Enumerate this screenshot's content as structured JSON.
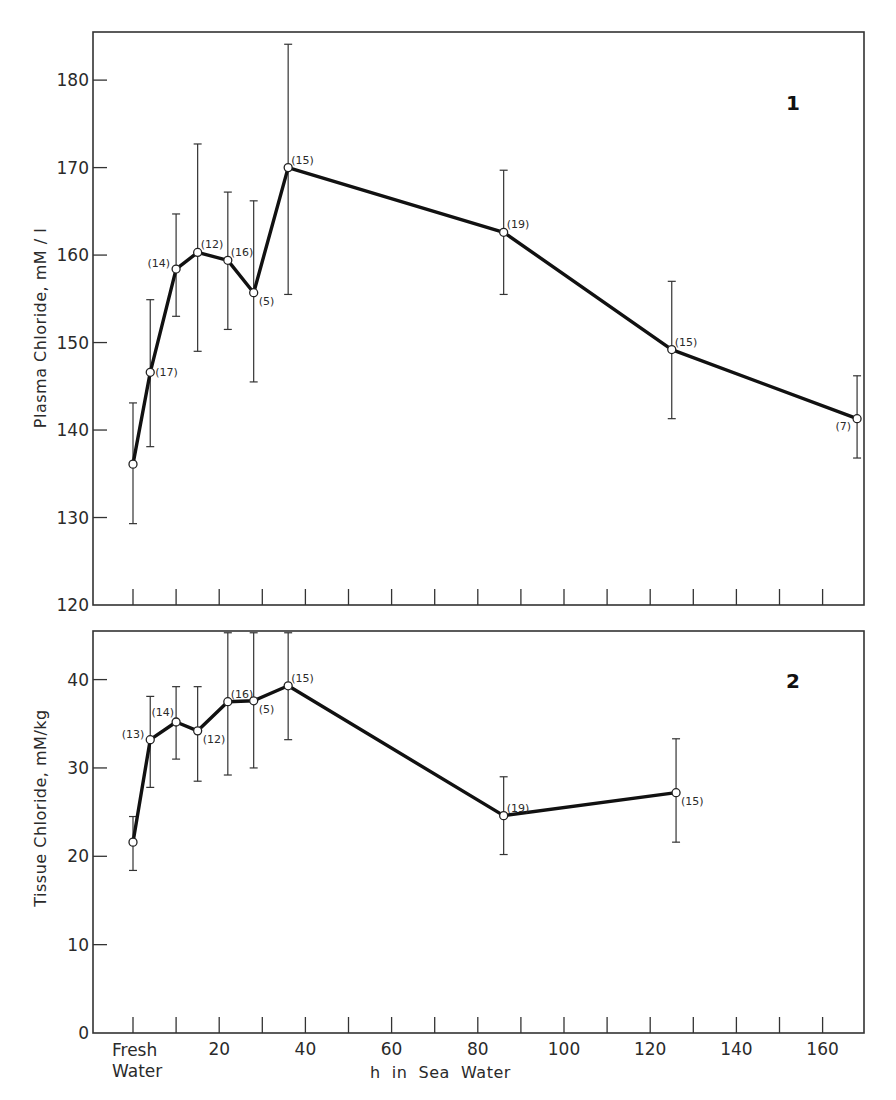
{
  "figure": {
    "x_axis_label": "h  in  Sea  Water",
    "fresh_water_label_line1": "Fresh",
    "fresh_water_label_line2": "Water",
    "colors": {
      "line": "#111111",
      "axis": "#333333",
      "marker_fill": "#ffffff",
      "background": "#ffffff"
    }
  },
  "chart_data": [
    {
      "type": "line",
      "panel_number": "1",
      "title": "",
      "xlabel": "h in Sea Water",
      "ylabel": "Plasma Chloride,   mM / l",
      "x_tick_labels": [],
      "x_ticks": [
        0,
        10,
        20,
        30,
        40,
        50,
        60,
        70,
        80,
        90,
        100,
        110,
        120,
        130,
        140,
        150,
        160
      ],
      "y_ticks": [
        120,
        130,
        140,
        150,
        160,
        170,
        180
      ],
      "xlim": [
        -9,
        170
      ],
      "ylim": [
        120,
        185.5
      ],
      "grid": false,
      "error_bars": true,
      "series": [
        {
          "name": "Plasma Chloride",
          "points": [
            {
              "x": 0,
              "y": 136.1,
              "err_low": 129.3,
              "err_high": 143.1,
              "n": "",
              "label_side": "none"
            },
            {
              "x": 4,
              "y": 146.6,
              "err_low": 138.1,
              "err_high": 154.9,
              "n": "(17)",
              "label_side": "right"
            },
            {
              "x": 10,
              "y": 158.4,
              "err_low": 153.0,
              "err_high": 164.7,
              "n": "(14)",
              "label_side": "left"
            },
            {
              "x": 15,
              "y": 160.3,
              "err_low": 149.0,
              "err_high": 172.7,
              "n": "(12)",
              "label_side": "upright"
            },
            {
              "x": 22,
              "y": 159.4,
              "err_low": 151.5,
              "err_high": 167.2,
              "n": "(16)",
              "label_side": "upright"
            },
            {
              "x": 28,
              "y": 155.7,
              "err_low": 145.5,
              "err_high": 166.2,
              "n": "(5)",
              "label_side": "downright"
            },
            {
              "x": 36,
              "y": 170.0,
              "err_low": 155.5,
              "err_high": 184.1,
              "n": "(15)",
              "label_side": "upright"
            },
            {
              "x": 86,
              "y": 162.6,
              "err_low": 155.5,
              "err_high": 169.7,
              "n": "(19)",
              "label_side": "upright"
            },
            {
              "x": 125,
              "y": 149.2,
              "err_low": 141.3,
              "err_high": 157.0,
              "n": "(15)",
              "label_side": "upright"
            },
            {
              "x": 168,
              "y": 141.3,
              "err_low": 136.8,
              "err_high": 146.2,
              "n": "(7)",
              "label_side": "downleft"
            }
          ]
        }
      ]
    },
    {
      "type": "line",
      "panel_number": "2",
      "title": "",
      "xlabel": "h in Sea Water",
      "ylabel": "Tissue  Chloride,  mM/kg",
      "x_tick_labels": [
        "Fresh Water",
        "20",
        "40",
        "60",
        "80",
        "100",
        "120",
        "140",
        "160"
      ],
      "x_ticks": [
        0,
        10,
        20,
        30,
        40,
        50,
        60,
        70,
        80,
        90,
        100,
        110,
        120,
        130,
        140,
        150,
        160
      ],
      "y_ticks": [
        0,
        10,
        20,
        30,
        40
      ],
      "xlim": [
        -9,
        170
      ],
      "ylim": [
        0,
        45.5
      ],
      "grid": false,
      "error_bars": true,
      "series": [
        {
          "name": "Tissue Chloride",
          "points": [
            {
              "x": 0,
              "y": 21.6,
              "err_low": 18.4,
              "err_high": 24.5,
              "n": "",
              "label_side": "none"
            },
            {
              "x": 4,
              "y": 33.2,
              "err_low": 27.8,
              "err_high": 38.1,
              "n": "(13)",
              "label_side": "left"
            },
            {
              "x": 10,
              "y": 35.2,
              "err_low": 31.0,
              "err_high": 39.2,
              "n": "(14)",
              "label_side": "upleft"
            },
            {
              "x": 15,
              "y": 34.2,
              "err_low": 28.5,
              "err_high": 39.2,
              "n": "(12)",
              "label_side": "downright"
            },
            {
              "x": 22,
              "y": 37.5,
              "err_low": 29.2,
              "err_high": 45.3,
              "n": "(16)",
              "label_side": "upright"
            },
            {
              "x": 28,
              "y": 37.6,
              "err_low": 30.0,
              "err_high": 45.3,
              "n": "(5)",
              "label_side": "downright"
            },
            {
              "x": 36,
              "y": 39.3,
              "err_low": 33.2,
              "err_high": 45.3,
              "n": "(15)",
              "label_side": "upright"
            },
            {
              "x": 86,
              "y": 24.6,
              "err_low": 20.2,
              "err_high": 29.0,
              "n": "(19)",
              "label_side": "upright"
            },
            {
              "x": 126,
              "y": 27.2,
              "err_low": 21.6,
              "err_high": 33.3,
              "n": "(15)",
              "label_side": "downright"
            }
          ]
        }
      ]
    }
  ]
}
